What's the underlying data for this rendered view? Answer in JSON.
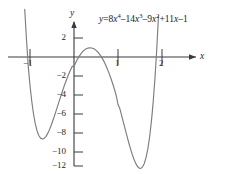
{
  "figure": {
    "title": "",
    "equation_text": "y = 8x^4 - 14x^3 - 9x^2 + 11x - 1",
    "curve_color": "#7d7d7d",
    "axis_color": "#3a3a3a",
    "background": "#ffffff"
  },
  "axes": {
    "x_label": "x",
    "y_label": "y",
    "x_ticks": [
      {
        "value": -1,
        "label": "−1"
      },
      {
        "value": 1,
        "label": "1"
      },
      {
        "value": 2,
        "label": "2"
      }
    ],
    "y_ticks": [
      {
        "value": 2,
        "label": "2"
      },
      {
        "value": -2,
        "label": "−2"
      },
      {
        "value": -4,
        "label": "−4"
      },
      {
        "value": -6,
        "label": "−6"
      },
      {
        "value": -8,
        "label": "−8"
      },
      {
        "value": -10,
        "label": "−10"
      },
      {
        "value": -12,
        "label": "−12"
      }
    ]
  },
  "equation_parts": {
    "lhs_y": "y",
    "equals": "=",
    "term1_coef": "8",
    "term1_var": "x",
    "term1_exp": "4",
    "op1": "–",
    "term2_coef": "14",
    "term2_var": "x",
    "term2_exp": "3",
    "op2": "–",
    "term3_coef": "9",
    "term3_var": "x",
    "term3_exp": "2",
    "op3": "+",
    "term4_coef": "11",
    "term4_var": "x",
    "op4": "–",
    "term5_const": "1"
  },
  "chart_data": {
    "type": "line",
    "title": "",
    "subtitle": "",
    "xlabel": "x",
    "ylabel": "y",
    "grid": false,
    "legend": null,
    "annotations": [
      {
        "text": "y = 8x^4 - 14x^3 - 9x^2 + 11x - 1",
        "x": 1.1,
        "y": 3.4
      }
    ],
    "xlim": [
      -1.45,
      2.35
    ],
    "ylim": [
      -13.2,
      3.6
    ],
    "xticks": [
      -1,
      1,
      2
    ],
    "yticks": [
      2,
      -2,
      -4,
      -6,
      -8,
      -10,
      -12
    ],
    "function": "y = 8*x^4 - 14*x^3 - 9*x^2 + 11*x - 1",
    "series": [
      {
        "name": "y = 8x^4 - 14x^3 - 9x^2 + 11x - 1",
        "color": "#7d7d7d",
        "x": [
          -1.12,
          -1.08,
          -1.04,
          -1.0,
          -0.96,
          -0.92,
          -0.88,
          -0.84,
          -0.8,
          -0.76,
          -0.72,
          -0.68,
          -0.64,
          -0.6,
          -0.56,
          -0.52,
          -0.48,
          -0.44,
          -0.4,
          -0.36,
          -0.32,
          -0.28,
          -0.24,
          -0.2,
          -0.16,
          -0.12,
          -0.08,
          -0.04,
          0.0,
          0.04,
          0.08,
          0.12,
          0.16,
          0.2,
          0.24,
          0.28,
          0.32,
          0.36,
          0.4,
          0.44,
          0.48,
          0.52,
          0.56,
          0.6,
          0.64,
          0.68,
          0.72,
          0.76,
          0.8,
          0.84,
          0.88,
          0.92,
          0.96,
          1.0,
          1.04,
          1.08,
          1.12,
          1.16,
          1.2,
          1.24,
          1.28,
          1.32,
          1.36,
          1.4,
          1.44,
          1.48,
          1.52,
          1.56,
          1.6,
          1.64,
          1.68,
          1.72,
          1.76,
          1.8,
          1.84,
          1.88,
          1.92,
          1.96,
          2.0,
          2.04,
          2.08,
          2.12
        ],
        "y": [
          5.01,
          1.87,
          -0.93,
          -3.0,
          -4.66,
          -6.0,
          -7.02,
          -7.76,
          -8.26,
          -8.54,
          -8.64,
          -8.57,
          -8.38,
          -8.07,
          -7.67,
          -7.21,
          -6.69,
          -6.14,
          -5.57,
          -4.99,
          -4.41,
          -3.84,
          -3.28,
          -2.76,
          -2.26,
          -1.79,
          -1.37,
          -0.98,
          -1.0,
          -0.58,
          -0.22,
          0.09,
          0.36,
          0.58,
          0.75,
          0.87,
          0.94,
          0.97,
          0.95,
          0.89,
          0.78,
          0.62,
          0.42,
          0.17,
          -0.12,
          -0.46,
          -0.85,
          -1.28,
          -1.75,
          -2.27,
          -2.82,
          -3.42,
          -4.05,
          -5.0,
          -5.4,
          -6.11,
          -6.83,
          -7.55,
          -8.26,
          -8.95,
          -9.6,
          -10.2,
          -10.73,
          -11.17,
          -11.5,
          -11.69,
          -11.72,
          -11.56,
          -11.18,
          -10.54,
          -9.62,
          -8.37,
          -6.75,
          -4.72,
          -2.23,
          0.77,
          4.34,
          8.53,
          13.0,
          18.3,
          24.3,
          31.1
        ]
      }
    ],
    "key_points": {
      "local_min_left": {
        "x": -0.71,
        "y": -8.65
      },
      "local_max": {
        "x": 0.37,
        "y": 0.97
      },
      "local_min_right": {
        "x": 1.52,
        "y": -11.72
      }
    }
  }
}
